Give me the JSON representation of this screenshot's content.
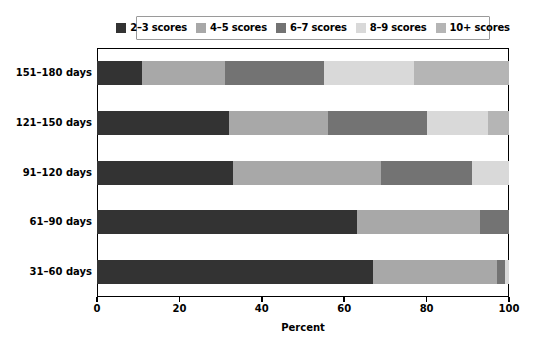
{
  "chart_data": {
    "type": "bar",
    "subtype": "stacked-horizontal-100",
    "title": "",
    "xlabel": "Percent",
    "ylabel": "",
    "xlim": [
      0,
      100
    ],
    "grid": false,
    "legend_position": "top",
    "orientation": "horizontal",
    "categories": [
      "151–180 days",
      "121–150 days",
      "91–120 days",
      "61–90 days",
      "31–60 days"
    ],
    "xticks": [
      "0",
      "20",
      "40",
      "60",
      "80",
      "100"
    ],
    "xtick_values": [
      0,
      20,
      40,
      60,
      80,
      100
    ],
    "series": [
      {
        "name": "2–3 scores",
        "color": "#333333",
        "values": [
          11,
          32,
          33,
          63,
          67
        ]
      },
      {
        "name": "4–5 scores",
        "color": "#a8a8a8",
        "values": [
          20,
          24,
          36,
          30,
          30
        ]
      },
      {
        "name": "6–7 scores",
        "color": "#737373",
        "values": [
          24,
          24,
          22,
          7,
          2
        ]
      },
      {
        "name": "8–9 scores",
        "color": "#d9d9d9",
        "values": [
          22,
          15,
          9,
          0,
          1
        ]
      },
      {
        "name": "10+ scores",
        "color": "#b5b5b5",
        "values": [
          23,
          5,
          0,
          0,
          0
        ]
      }
    ]
  },
  "legend": {
    "items": [
      {
        "label": "2–3 scores",
        "color": "#333333"
      },
      {
        "label": "4–5 scores",
        "color": "#a8a8a8"
      },
      {
        "label": "6–7 scores",
        "color": "#737373"
      },
      {
        "label": "8–9 scores",
        "color": "#d9d9d9"
      },
      {
        "label": "10+ scores",
        "color": "#b5b5b5"
      }
    ]
  },
  "axis": {
    "x_title": "Percent",
    "x_ticks": [
      "0",
      "20",
      "40",
      "60",
      "80",
      "100"
    ]
  },
  "categories": {
    "labels": [
      "151–180 days",
      "121–150 days",
      "91–120 days",
      "61–90 days",
      "31–60 days"
    ]
  }
}
